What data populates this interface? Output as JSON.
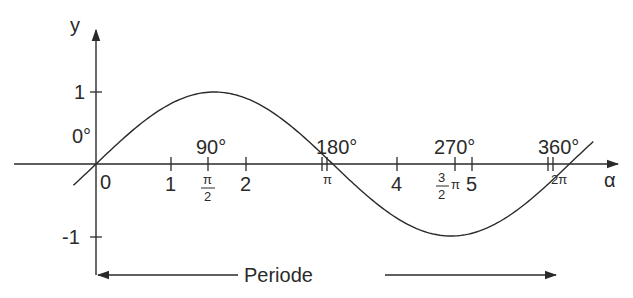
{
  "chart_data": {
    "type": "line",
    "title": "",
    "function": "y = sin(alpha)",
    "xlabel": "α",
    "ylabel": "y",
    "x_ticks_numeric": [
      "0",
      "1",
      "2",
      "4",
      "5"
    ],
    "x_ticks_numeric_values": [
      0,
      1,
      2,
      4,
      5
    ],
    "x_ticks_unlabeled_values": [
      3,
      6
    ],
    "x_ticks_pi": [
      {
        "label": "π/2",
        "num": "π",
        "den": "2",
        "value": 1.5708
      },
      {
        "label": "π",
        "value": 3.1416
      },
      {
        "label": "3/2 π",
        "num": "3",
        "den": "2",
        "suffix": "π",
        "value": 4.7124
      },
      {
        "label": "2π",
        "value": 6.2832
      }
    ],
    "degree_labels": [
      {
        "label": "0°",
        "value": 0
      },
      {
        "label": "90°",
        "value": 1.5708
      },
      {
        "label": "180°",
        "value": 3.1416
      },
      {
        "label": "270°",
        "value": 4.7124
      },
      {
        "label": "360°",
        "value": 6.2832
      }
    ],
    "y_ticks": [
      "1",
      "-1"
    ],
    "y_ticks_values": [
      1,
      -1
    ],
    "x_range": [
      -0.3,
      6.6
    ],
    "ylim": [
      -1.4,
      1.6
    ],
    "grid": false,
    "legend": null,
    "series": [
      {
        "name": "sin α",
        "x": [
          -0.3,
          0,
          0.5236,
          1.0472,
          1.5708,
          2.0944,
          2.618,
          3.1416,
          3.6652,
          4.1888,
          4.7124,
          5.236,
          5.7596,
          6.2832,
          6.6
        ],
        "values": [
          -0.296,
          0,
          0.5,
          0.866,
          1,
          0.866,
          0.5,
          0,
          -0.5,
          -0.866,
          -1,
          -0.866,
          -0.5,
          0,
          0.311
        ]
      }
    ],
    "annotations": [
      {
        "text": "Periode",
        "type": "double-arrow",
        "from": 0,
        "to": 6.2832
      }
    ]
  },
  "labels": {
    "y_axis": "y",
    "x_axis": "α",
    "y_one": "1",
    "y_minus_one": "-1",
    "deg0": "0°",
    "deg90": "90°",
    "deg180": "180°",
    "deg270": "270°",
    "deg360": "360°",
    "x0": "0",
    "x1": "1",
    "x2": "2",
    "x4": "4",
    "x5": "5",
    "pi_half_num": "π",
    "pi_half_den": "2",
    "pi": "π",
    "three_half_num": "3",
    "three_half_den": "2",
    "three_half_pi": "π",
    "two_pi": "2π",
    "period": "Periode"
  }
}
